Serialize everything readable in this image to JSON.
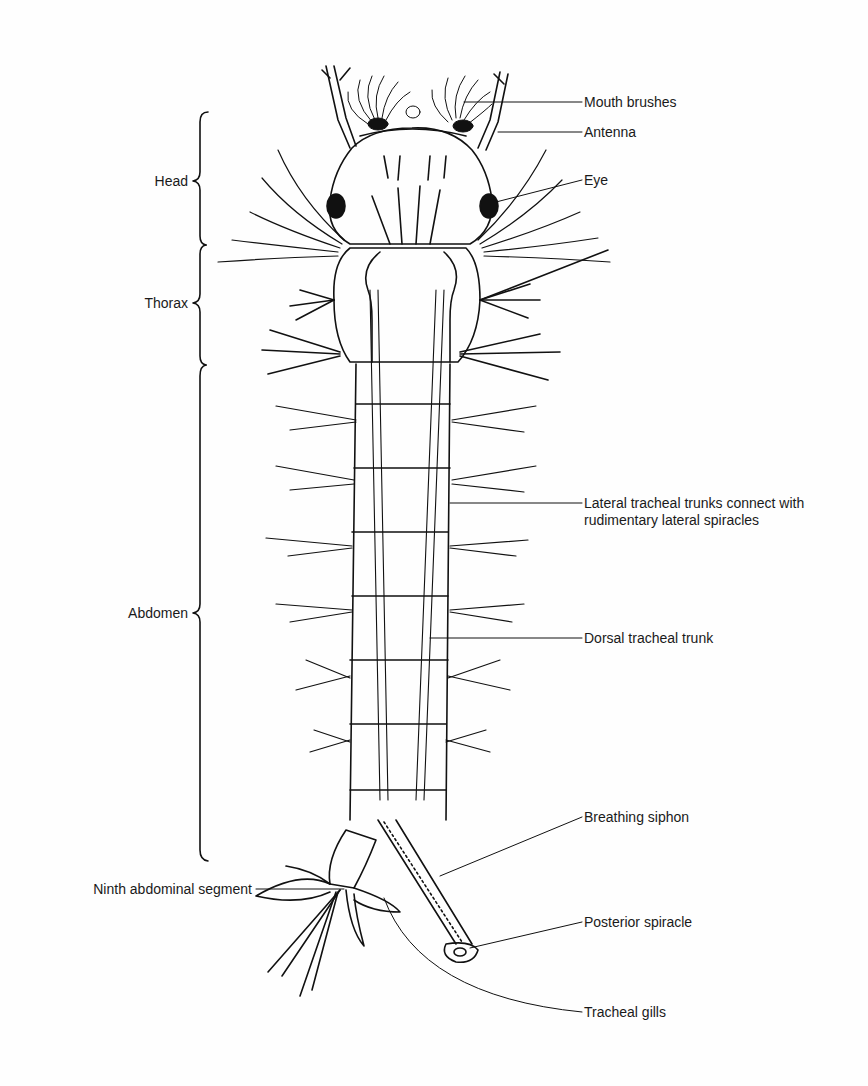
{
  "figure": {
    "regions": [
      {
        "id": "head",
        "label": "Head"
      },
      {
        "id": "thorax",
        "label": "Thorax"
      },
      {
        "id": "abdomen",
        "label": "Abdomen"
      }
    ],
    "left_labels": [
      {
        "id": "ninth-segment",
        "label": "Ninth abdominal segment"
      }
    ],
    "right_labels": [
      {
        "id": "mouth-brushes",
        "label": "Mouth brushes"
      },
      {
        "id": "antenna",
        "label": "Antenna"
      },
      {
        "id": "eye",
        "label": "Eye"
      },
      {
        "id": "lateral-tracheal-trunks",
        "label": "Lateral tracheal trunks connect with rudimentary lateral spiracles"
      },
      {
        "id": "dorsal-tracheal-trunk",
        "label": "Dorsal tracheal trunk"
      },
      {
        "id": "breathing-siphon",
        "label": "Breathing siphon"
      },
      {
        "id": "posterior-spiracle",
        "label": "Posterior spiracle"
      },
      {
        "id": "tracheal-gills",
        "label": "Tracheal gills"
      }
    ]
  }
}
